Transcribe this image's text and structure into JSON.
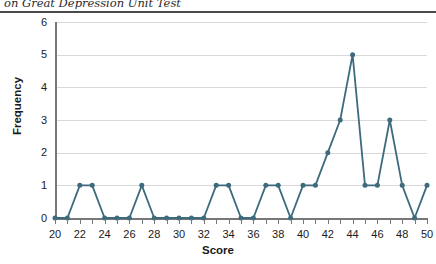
{
  "chart_data": {
    "type": "line",
    "title": "on Great Depression Unit Test",
    "xlabel": "Score",
    "ylabel": "Frequency",
    "xlim": [
      20,
      50
    ],
    "ylim": [
      0,
      6
    ],
    "grid": true,
    "legend": false,
    "marker": "circle",
    "x_tick_labels": [
      "20",
      "22",
      "24",
      "26",
      "28",
      "30",
      "32",
      "34",
      "36",
      "38",
      "40",
      "42",
      "44",
      "46",
      "48",
      "50"
    ],
    "x_tick_values": [
      20,
      22,
      24,
      26,
      28,
      30,
      32,
      34,
      36,
      38,
      40,
      42,
      44,
      46,
      48,
      50
    ],
    "x_minor_tick_values": [
      20,
      21,
      22,
      23,
      24,
      25,
      26,
      27,
      28,
      29,
      30,
      31,
      32,
      33,
      34,
      35,
      36,
      37,
      38,
      39,
      40,
      41,
      42,
      43,
      44,
      45,
      46,
      47,
      48,
      49,
      50
    ],
    "y_tick_labels": [
      "0",
      "1",
      "2",
      "3",
      "4",
      "5",
      "6"
    ],
    "y_tick_values": [
      0,
      1,
      2,
      3,
      4,
      5,
      6
    ],
    "x": [
      20,
      21,
      22,
      23,
      24,
      25,
      26,
      27,
      28,
      29,
      30,
      31,
      32,
      33,
      34,
      35,
      36,
      37,
      38,
      39,
      40,
      41,
      42,
      43,
      44,
      45,
      46,
      47,
      48,
      49,
      50
    ],
    "values": [
      0,
      0,
      1,
      1,
      0,
      0,
      0,
      1,
      0,
      0,
      0,
      0,
      0,
      1,
      1,
      0,
      0,
      1,
      1,
      0,
      1,
      1,
      2,
      3,
      5,
      1,
      1,
      3,
      1,
      0,
      1
    ],
    "series_color": "#3d6b7d",
    "grid_color": "#d9d9d9",
    "axis_color": "#777777"
  }
}
